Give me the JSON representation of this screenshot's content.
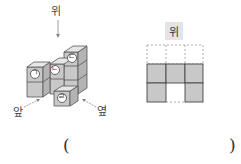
{
  "figure": {
    "direction_labels": {
      "top": "위",
      "front": "앞",
      "side": "옆"
    },
    "cube_labels": [
      "ㄱ",
      "ㄴ",
      "ㄷ",
      "ㄹ"
    ],
    "view_label": "위",
    "grid": {
      "columns": 3,
      "rows_total": 3,
      "dashed_rows": 1,
      "filled_cells": [
        [
          1,
          1,
          1
        ],
        [
          1,
          0,
          1
        ]
      ]
    }
  },
  "answer": {
    "open": "(",
    "close": ")"
  },
  "colors": {
    "cube_front": "#c8c8c8",
    "cube_top": "#e6e6e6",
    "cube_side": "#b4b4b4",
    "cell_fill": "#c8c8c8",
    "stroke": "#444444"
  }
}
